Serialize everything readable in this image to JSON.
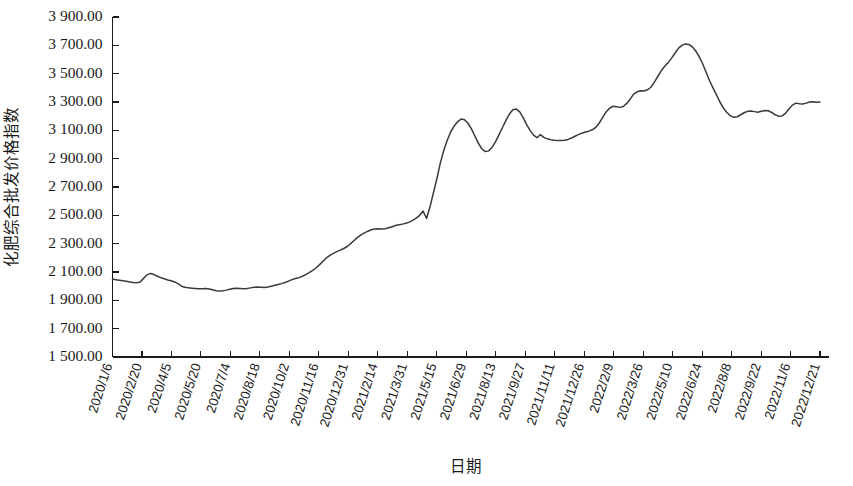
{
  "chart_data": {
    "type": "line",
    "title": "",
    "xlabel": "日期",
    "ylabel": "化肥综合批发价格指数",
    "ylim": [
      1500,
      3900
    ],
    "ytick_step": 200,
    "grid": false,
    "legend": null,
    "line_color": "#3a3a3a",
    "ytick_labels": [
      "3 900.00",
      "3 700.00",
      "3 500.00",
      "3 300.00",
      "3 100.00",
      "2 900.00",
      "2 700.00",
      "2 500.00",
      "2 300.00",
      "2 100.00",
      "1 900.00",
      "1 700.00",
      "1 500.00"
    ],
    "ytick_values": [
      3900,
      3700,
      3500,
      3300,
      3100,
      2900,
      2700,
      2500,
      2300,
      2100,
      1900,
      1700,
      1500
    ],
    "xtick_labels": [
      "2020/1/6",
      "2020/2/20",
      "2020/4/5",
      "2020/5/20",
      "2020/7/4",
      "2020/8/18",
      "2020/10/2",
      "2020/11/16",
      "2020/12/31",
      "2021/2/14",
      "2021/3/31",
      "2021/5/15",
      "2021/6/29",
      "2021/8/13",
      "2021/9/27",
      "2021/11/11",
      "2021/12/26",
      "2022/2/9",
      "2022/3/26",
      "2022/5/10",
      "2022/6/24",
      "2022/8/8",
      "2022/9/22",
      "2022/11/6",
      "2022/12/21"
    ],
    "series": [
      {
        "name": "化肥综合批发价格指数",
        "values": [
          2050,
          2046,
          2042,
          2038,
          2034,
          2030,
          2026,
          2024,
          2030,
          2055,
          2080,
          2090,
          2082,
          2070,
          2060,
          2052,
          2044,
          2038,
          2030,
          2018,
          2000,
          1992,
          1988,
          1986,
          1984,
          1982,
          1982,
          1984,
          1980,
          1974,
          1968,
          1966,
          1968,
          1972,
          1978,
          1984,
          1986,
          1984,
          1982,
          1984,
          1988,
          1992,
          1994,
          1992,
          1990,
          1994,
          2000,
          2006,
          2012,
          2018,
          2026,
          2036,
          2046,
          2054,
          2060,
          2070,
          2082,
          2096,
          2112,
          2130,
          2152,
          2176,
          2200,
          2218,
          2232,
          2244,
          2254,
          2266,
          2280,
          2300,
          2322,
          2344,
          2362,
          2376,
          2388,
          2398,
          2404,
          2406,
          2404,
          2406,
          2412,
          2420,
          2428,
          2434,
          2438,
          2444,
          2452,
          2464,
          2480,
          2500,
          2530,
          2478,
          2560,
          2660,
          2760,
          2870,
          2960,
          3030,
          3090,
          3130,
          3160,
          3180,
          3175,
          3150,
          3110,
          3060,
          3010,
          2970,
          2950,
          2955,
          2980,
          3020,
          3070,
          3120,
          3170,
          3215,
          3245,
          3250,
          3230,
          3190,
          3140,
          3100,
          3066,
          3048,
          3070,
          3050,
          3040,
          3034,
          3030,
          3028,
          3028,
          3030,
          3036,
          3046,
          3058,
          3070,
          3080,
          3088,
          3094,
          3104,
          3120,
          3150,
          3190,
          3230,
          3255,
          3270,
          3266,
          3262,
          3268,
          3290,
          3320,
          3356,
          3372,
          3380,
          3378,
          3386,
          3404,
          3440,
          3480,
          3520,
          3552,
          3578,
          3610,
          3646,
          3680,
          3700,
          3710,
          3706,
          3690,
          3660,
          3620,
          3570,
          3510,
          3450,
          3400,
          3350,
          3300,
          3258,
          3226,
          3204,
          3192,
          3196,
          3210,
          3224,
          3234,
          3236,
          3232,
          3228,
          3234,
          3240,
          3238,
          3226,
          3210,
          3200,
          3202,
          3220,
          3250,
          3278,
          3292,
          3288,
          3286,
          3292,
          3300,
          3302,
          3298,
          3300
        ]
      }
    ]
  }
}
